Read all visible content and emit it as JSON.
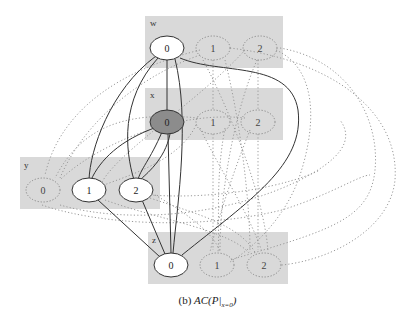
{
  "caption": {
    "prefix": "(b)",
    "expr_main": "AC(P|",
    "expr_sub": "x=0",
    "expr_close": ")"
  },
  "colors": {
    "cluster_fill": "#d9d9d9",
    "selected_node_fill": "#8c8c8c",
    "node_fill": "#ffffff",
    "edge_solid": "#333333",
    "edge_dotted": "#999999"
  },
  "clusters": [
    {
      "id": "w",
      "label": "w",
      "x": 145,
      "y": 16,
      "w": 138,
      "h": 52
    },
    {
      "id": "x",
      "label": "x",
      "x": 145,
      "y": 88,
      "w": 138,
      "h": 52
    },
    {
      "id": "y",
      "label": "y",
      "x": 20,
      "y": 157,
      "w": 140,
      "h": 52
    },
    {
      "id": "z",
      "label": "z",
      "x": 148,
      "y": 232,
      "w": 140,
      "h": 52
    }
  ],
  "nodes": [
    {
      "id": "w0",
      "label": "0",
      "cx": 167,
      "cy": 48,
      "style": "solid"
    },
    {
      "id": "w1",
      "label": "1",
      "cx": 213,
      "cy": 48,
      "style": "dotted"
    },
    {
      "id": "w2",
      "label": "2",
      "cx": 260,
      "cy": 48,
      "style": "dotted"
    },
    {
      "id": "x0",
      "label": "0",
      "cx": 167,
      "cy": 122,
      "style": "selected"
    },
    {
      "id": "x1",
      "label": "1",
      "cx": 213,
      "cy": 122,
      "style": "dotted"
    },
    {
      "id": "x2",
      "label": "2",
      "cx": 258,
      "cy": 122,
      "style": "dotted"
    },
    {
      "id": "y0",
      "label": "0",
      "cx": 43,
      "cy": 190,
      "style": "dotted"
    },
    {
      "id": "y1",
      "label": "1",
      "cx": 89,
      "cy": 190,
      "style": "solid"
    },
    {
      "id": "y2",
      "label": "2",
      "cx": 136,
      "cy": 190,
      "style": "solid"
    },
    {
      "id": "z0",
      "label": "0",
      "cx": 171,
      "cy": 265,
      "style": "solid"
    },
    {
      "id": "z1",
      "label": "1",
      "cx": 217,
      "cy": 265,
      "style": "dotted"
    },
    {
      "id": "z2",
      "label": "2",
      "cx": 264,
      "cy": 265,
      "style": "dotted"
    }
  ]
}
